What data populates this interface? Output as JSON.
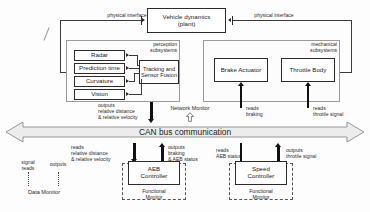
{
  "diagram": {
    "plant": {
      "line1": "Vehicle dynamics",
      "line2": "(plant)"
    },
    "physical_interface_left": "physical interface",
    "physical_interface_right": "physical interface",
    "perception": {
      "group_label": "perception\nsubsystems",
      "sensors": [
        "Radar",
        "Prediction time",
        "Curvature",
        "Vision"
      ],
      "fusion": {
        "line1": "Tracking and",
        "line2": "Sensor Fusion"
      }
    },
    "mechanical": {
      "group_label": "mechanical\nsubsystems",
      "actuators": [
        "Brake Actuator",
        "Throttle Body"
      ]
    },
    "bus": {
      "label": "CAN bus communication"
    },
    "network_monitor": {
      "label": "Network Monitor",
      "arrow": "arrow-up-hollow"
    },
    "bus_labels_above": [
      "outputs\nrelative distance\n& relative velocity",
      "reads\nbraking",
      "reads\nthrottle signal"
    ],
    "bus_labels_below": [
      "reads\nrelative distance\n& relative velocity",
      "outputs\nbraking\n& AEB status",
      "reads\nAEB status",
      "outputs\nthrottle signal"
    ],
    "controllers": [
      {
        "line1": "AEB",
        "line2": "Controller",
        "monitor_line1": "Functional",
        "monitor_line2": "Monitor"
      },
      {
        "line1": "Speed",
        "line2": "Controller",
        "monitor_line1": "Functional",
        "monitor_line2": "Monitor"
      }
    ],
    "data_monitor": {
      "label": "Data Monitor",
      "left_label": "signal\nreads",
      "right_label": "outputs"
    },
    "colors": {
      "box_border": "#2b2b2b",
      "group_border": "#9a9a9a",
      "bus_fill": "#ececec",
      "bus_border": "#8d8d8d",
      "arrow_black": "#111111",
      "text": "#1a1a1a"
    }
  }
}
